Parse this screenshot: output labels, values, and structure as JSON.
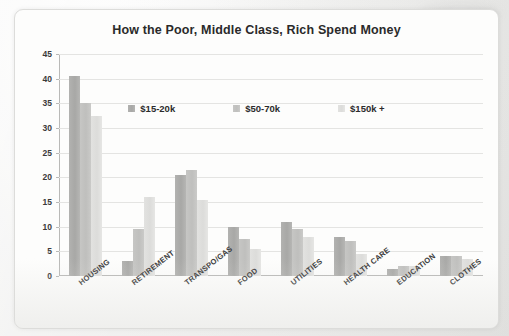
{
  "chart_data": {
    "type": "bar",
    "title": "How the Poor, Middle Class, Rich Spend Money",
    "xlabel": "",
    "ylabel": "",
    "ylim": [
      0,
      45
    ],
    "yticks": [
      0,
      5,
      10,
      15,
      20,
      25,
      30,
      35,
      40,
      45
    ],
    "grid": true,
    "legend_position": "top-center",
    "categories": [
      "Housing",
      "Retirement",
      "Transpo/Gas",
      "Food",
      "Utilities",
      "Health Care",
      "Education",
      "Clothes"
    ],
    "series": [
      {
        "name": "$15-20k",
        "color": "#aaaaa8",
        "values": [
          40.5,
          3,
          20.5,
          10,
          11,
          8,
          1.5,
          4
        ]
      },
      {
        "name": "$50-70k",
        "color": "#c2c2c0",
        "values": [
          35,
          9.5,
          21.5,
          7.5,
          9.5,
          7,
          2,
          4
        ]
      },
      {
        "name": "$150k +",
        "color": "#e0e0de",
        "values": [
          32.5,
          16,
          15.5,
          5.5,
          8,
          4.5,
          2,
          3.5
        ]
      }
    ]
  },
  "legend": {
    "items": [
      {
        "label": "$15-20k"
      },
      {
        "label": "$50-70k"
      },
      {
        "label": "$150k +"
      }
    ]
  }
}
